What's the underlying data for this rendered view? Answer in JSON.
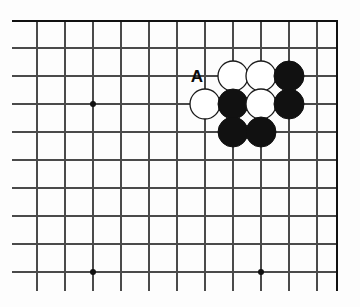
{
  "diagram": {
    "board": {
      "type": "go-board-partial",
      "corner": "top-right",
      "line_color": "#4a4a4a",
      "edge_color": "#111111",
      "background_color": "#fdfdfd",
      "grid_spacing": 28,
      "origin_x": 37,
      "origin_y": 20,
      "columns": 11,
      "rows": 10,
      "top_edge_y": 21,
      "right_edge_x": 337,
      "vertical_lines_x": [
        37,
        65,
        93,
        121,
        149,
        177,
        205,
        233,
        261,
        289,
        317
      ],
      "horizontal_lines_y": [
        21,
        48,
        76,
        104,
        132,
        160,
        188,
        216,
        244,
        272
      ],
      "vertical_line_bottom_y": 291,
      "star_points": [
        {
          "x": 93,
          "y": 104
        },
        {
          "x": 93,
          "y": 272
        },
        {
          "x": 261,
          "y": 272
        }
      ],
      "star_point_radius": 3,
      "star_point_color": "#111111"
    },
    "stones": [
      {
        "color": "white",
        "x": 233,
        "y": 76
      },
      {
        "color": "white",
        "x": 261,
        "y": 76
      },
      {
        "color": "black",
        "x": 289,
        "y": 76
      },
      {
        "color": "white",
        "x": 205,
        "y": 104
      },
      {
        "color": "black",
        "x": 233,
        "y": 104
      },
      {
        "color": "white",
        "x": 261,
        "y": 104
      },
      {
        "color": "black",
        "x": 289,
        "y": 104
      },
      {
        "color": "black",
        "x": 233,
        "y": 132
      },
      {
        "color": "black",
        "x": 261,
        "y": 132
      }
    ],
    "stone_radius": 15,
    "stone_colors": {
      "black_fill": "#111111",
      "black_stroke": "#111111",
      "white_fill": "#ffffff",
      "white_stroke": "#1a1a1a"
    },
    "annotations": [
      {
        "text": "A",
        "x": 197,
        "y": 76,
        "name": "point-label-a"
      }
    ]
  }
}
